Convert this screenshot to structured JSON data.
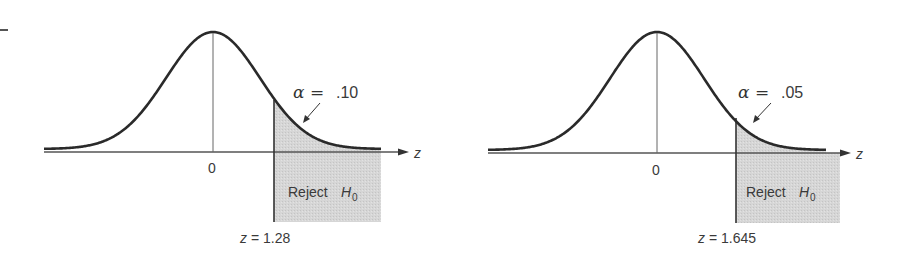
{
  "chart_data": [
    {
      "type": "area",
      "title": "",
      "description": "Standard normal curve with right-tail rejection region",
      "xlabel": "z",
      "center_tick": "0",
      "alpha_label": "α =",
      "alpha_value": ".10",
      "alpha": 0.1,
      "critical_value": 1.28,
      "critical_label": "z = 1.28",
      "region_label": "Reject",
      "region_symbol": "H",
      "region_subscript": "0",
      "tail": "right"
    },
    {
      "type": "area",
      "title": "",
      "description": "Standard normal curve with right-tail rejection region",
      "xlabel": "z",
      "center_tick": "0",
      "alpha_label": "α =",
      "alpha_value": ".05",
      "alpha": 0.05,
      "critical_value": 1.645,
      "critical_label": "z = 1.645",
      "region_label": "Reject",
      "region_symbol": "H",
      "region_subscript": "0",
      "tail": "right"
    }
  ],
  "colors": {
    "curve": "#2a2a2a",
    "axis": "#555555",
    "shade": "#d4d4d4",
    "text": "#3a3a3a"
  }
}
